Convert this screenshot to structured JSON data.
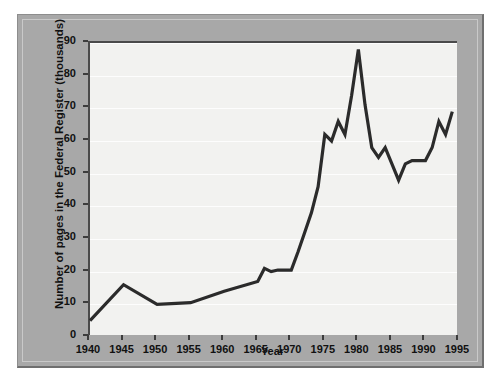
{
  "chart_data": {
    "type": "line",
    "title": "",
    "xlabel": "Year",
    "ylabel": "Number of pages in the Federal Register (thousands)",
    "xlim": [
      1940,
      1995
    ],
    "ylim": [
      0,
      90
    ],
    "grid": true,
    "legend": "none",
    "xticks": [
      1940,
      1945,
      1950,
      1955,
      1960,
      1965,
      1970,
      1975,
      1980,
      1985,
      1990,
      1995
    ],
    "yticks": [
      0,
      10,
      20,
      30,
      40,
      50,
      60,
      70,
      80,
      90
    ],
    "series": [
      {
        "name": "Pages in the Federal Register",
        "color": "#2b2b2b",
        "x": [
          1940,
          1945,
          1950,
          1955,
          1960,
          1965,
          1966,
          1967,
          1968,
          1969,
          1970,
          1971,
          1972,
          1973,
          1974,
          1975,
          1976,
          1977,
          1978,
          1979,
          1980,
          1981,
          1982,
          1983,
          1984,
          1985,
          1986,
          1987,
          1988,
          1989,
          1990,
          1991,
          1992,
          1993,
          1994
        ],
        "y": [
          5,
          16,
          10,
          10.5,
          14,
          17,
          21,
          20,
          20.5,
          20.5,
          20.5,
          26,
          32,
          38,
          46,
          62,
          60,
          66,
          62,
          74,
          88,
          71,
          58,
          55,
          58,
          53,
          48,
          53,
          54,
          54,
          54,
          58,
          66,
          62,
          69
        ]
      }
    ],
    "axis_ticks_labels_x": [
      "1940",
      "1945",
      "1950",
      "1955",
      "1960",
      "1965",
      "1970",
      "1975",
      "1980",
      "1985",
      "1990",
      "1995"
    ],
    "axis_ticks_labels_y": [
      "0",
      "10",
      "20",
      "30",
      "40",
      "50",
      "60",
      "70",
      "80",
      "90"
    ]
  },
  "colors": {
    "panel": "#a8a8a8",
    "plot_background": "#f2f2f0",
    "line": "#2b2b2b",
    "axis": "#4a4a4a",
    "gridline": "#ffffff"
  }
}
